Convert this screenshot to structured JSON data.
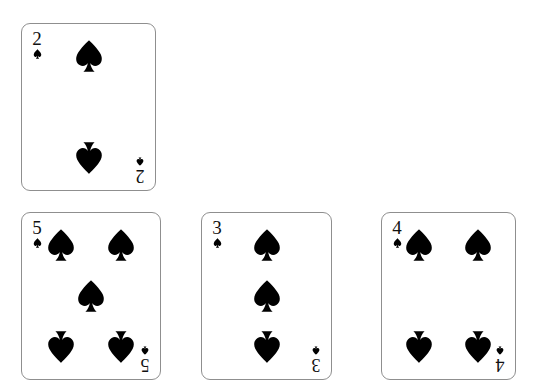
{
  "scene": {
    "title": "Four playing cards of the spade suit",
    "background_color": "#ffffff",
    "card_face_color": "#ffffff",
    "card_border_color": "#8f8f8f",
    "pip_color": "#000000",
    "suit_name": "spades",
    "suit_symbol": "♠"
  },
  "cards": [
    {
      "id": "card-2-spades",
      "rank": "2",
      "suit": "spades",
      "suit_symbol": "♠",
      "name": "two-of-spades",
      "left": 21,
      "top": 23,
      "width": 135,
      "height": 168,
      "pip_count": 2,
      "pips": [
        {
          "x": 50,
          "y": 19,
          "flipped": false
        },
        {
          "x": 50,
          "y": 81,
          "flipped": true
        }
      ]
    },
    {
      "id": "card-5-spades",
      "rank": "5",
      "suit": "spades",
      "suit_symbol": "♠",
      "name": "five-of-spades",
      "left": 21,
      "top": 212,
      "width": 140,
      "height": 168,
      "pip_count": 5,
      "pips": [
        {
          "x": 28,
          "y": 19,
          "flipped": false
        },
        {
          "x": 72,
          "y": 19,
          "flipped": false
        },
        {
          "x": 50,
          "y": 50,
          "flipped": false
        },
        {
          "x": 28,
          "y": 81,
          "flipped": true
        },
        {
          "x": 72,
          "y": 81,
          "flipped": true
        }
      ]
    },
    {
      "id": "card-3-spades",
      "rank": "3",
      "suit": "spades",
      "suit_symbol": "♠",
      "name": "three-of-spades",
      "left": 201,
      "top": 212,
      "width": 131,
      "height": 168,
      "pip_count": 3,
      "pips": [
        {
          "x": 50,
          "y": 19,
          "flipped": false
        },
        {
          "x": 50,
          "y": 50,
          "flipped": false
        },
        {
          "x": 50,
          "y": 81,
          "flipped": true
        }
      ]
    },
    {
      "id": "card-4-spades",
      "rank": "4",
      "suit": "spades",
      "suit_symbol": "♠",
      "name": "four-of-spades",
      "left": 381,
      "top": 212,
      "width": 135,
      "height": 168,
      "pip_count": 4,
      "pips": [
        {
          "x": 28,
          "y": 19,
          "flipped": false
        },
        {
          "x": 72,
          "y": 19,
          "flipped": false
        },
        {
          "x": 28,
          "y": 81,
          "flipped": true
        },
        {
          "x": 72,
          "y": 81,
          "flipped": true
        }
      ]
    }
  ]
}
